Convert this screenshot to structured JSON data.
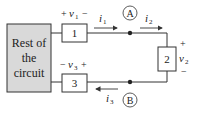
{
  "diagram": {
    "rest_box": {
      "lines": [
        "Rest of",
        "the",
        "circuit"
      ],
      "fill": "#d9d9d9"
    },
    "elements": [
      {
        "id": "1",
        "label": "1",
        "voltage": {
          "plus": "+",
          "name": "v",
          "sub": "1",
          "minus": "−"
        }
      },
      {
        "id": "2",
        "label": "2",
        "voltage": {
          "plus": "+",
          "name": "v",
          "sub": "2",
          "minus": "−"
        }
      },
      {
        "id": "3",
        "label": "3",
        "voltage": {
          "minus": "−",
          "name": "v",
          "sub": "3",
          "plus": "+"
        }
      }
    ],
    "nodes": [
      {
        "label": "A"
      },
      {
        "label": "B"
      }
    ],
    "currents": [
      {
        "name": "i",
        "sub": "1"
      },
      {
        "name": "i",
        "sub": "2"
      },
      {
        "name": "i",
        "sub": "3"
      }
    ]
  }
}
